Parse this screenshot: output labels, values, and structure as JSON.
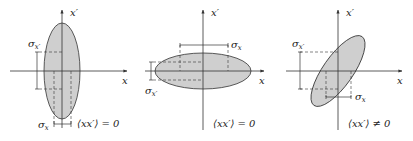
{
  "panels": [
    {
      "id": "vertical",
      "x_axis_label": "x",
      "y_axis_label": "x′",
      "sigma_x_label": "σ",
      "sigma_x_sub": "x",
      "sigma_xp_label": "σ",
      "sigma_xp_sub": "x′",
      "correlation_label": "⟨xx′⟩ = 0"
    },
    {
      "id": "horizontal",
      "x_axis_label": "x",
      "y_axis_label": "x′",
      "sigma_x_label": "σ",
      "sigma_x_sub": "x",
      "sigma_xp_label": "σ",
      "sigma_xp_sub": "x′",
      "correlation_label": "⟨xx′⟩ = 0"
    },
    {
      "id": "tilted",
      "x_axis_label": "x",
      "y_axis_label": "x′",
      "sigma_x_label": "σ",
      "sigma_x_sub": "x",
      "sigma_xp_label": "σ",
      "sigma_xp_sub": "x′",
      "correlation_label": "⟨xx′⟩ ≠ 0"
    }
  ],
  "colors": {
    "ellipse_fill": "#cfcfcf",
    "ellipse_stroke": "#333333",
    "axis": "#333333"
  }
}
